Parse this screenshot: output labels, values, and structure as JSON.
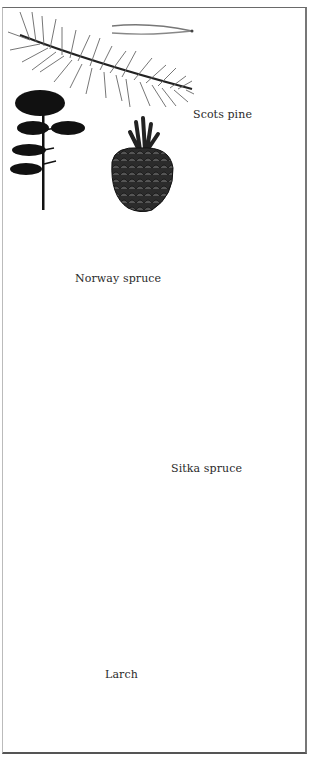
{
  "page": {
    "type": "book-illustration-plate",
    "top_caption_visible": false
  },
  "species": [
    {
      "name": "Scots pine",
      "illustrations": [
        "needle-pair",
        "shoot",
        "tree-silhouette",
        "cone"
      ]
    },
    {
      "name": "Norway spruce",
      "illustrations": [
        "shoot",
        "tree-silhouette",
        "hanging-cone"
      ]
    },
    {
      "name": "Sitka spruce",
      "illustrations": [
        "shoot",
        "tree-silhouette",
        "cone"
      ]
    },
    {
      "name": "Larch",
      "illustrations": [
        "cone-with-needle-tuft",
        "shoot",
        "tree-silhouette"
      ]
    }
  ],
  "colors": {
    "ink": "#1a1a1a",
    "needle_gray": "#6b6b6b",
    "border": "#666666",
    "paper": "#ffffff"
  }
}
